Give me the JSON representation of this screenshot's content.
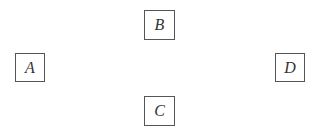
{
  "diagram": {
    "nodes": [
      {
        "id": "A",
        "label": "A"
      },
      {
        "id": "B",
        "label": "B"
      },
      {
        "id": "C",
        "label": "C"
      },
      {
        "id": "D",
        "label": "D"
      }
    ]
  }
}
